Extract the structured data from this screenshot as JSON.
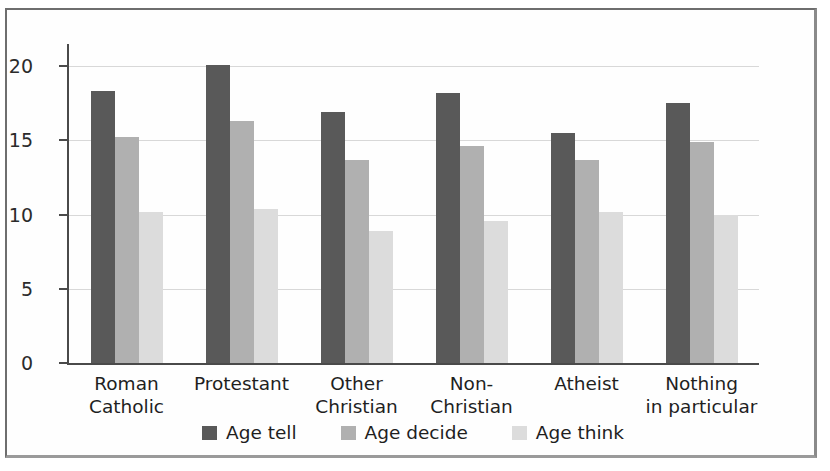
{
  "chart_data": {
    "type": "bar",
    "title": "",
    "subtitle": "",
    "xlabel": "",
    "ylabel": "",
    "categories": [
      "Roman\nCatholic",
      "Protestant",
      "Other\nChristian",
      "Non-\nChristian",
      "Atheist",
      "Nothing\nin particular"
    ],
    "series": [
      {
        "name": "Age tell",
        "color": "#595959",
        "values": [
          18.3,
          20.1,
          16.9,
          18.2,
          15.5,
          17.5
        ]
      },
      {
        "name": "Age decide",
        "color": "#b0b0b0",
        "values": [
          15.2,
          16.3,
          13.7,
          14.6,
          13.7,
          14.9
        ]
      },
      {
        "name": "Age think",
        "color": "#dcdcdc",
        "values": [
          10.2,
          10.4,
          8.9,
          9.6,
          10.2,
          10.0
        ]
      }
    ],
    "ylim": [
      0,
      21.5
    ],
    "yticks": [
      0,
      5,
      10,
      15,
      20
    ],
    "ytick_labels": [
      "0",
      "5",
      "10",
      "15",
      "20"
    ],
    "grid": true,
    "grid_axis": "y",
    "legend_position": "bottom-center",
    "bar_group_order": [
      "Age tell",
      "Age decide",
      "Age think"
    ]
  },
  "legend": {
    "items": [
      {
        "label": "Age tell",
        "swatch": "#595959"
      },
      {
        "label": "Age decide",
        "swatch": "#b0b0b0"
      },
      {
        "label": "Age think",
        "swatch": "#dcdcdc"
      }
    ]
  },
  "colors": {
    "axis": "#4a4a4a",
    "grid": "#d8d8d8",
    "frame": "#6e6e6e",
    "background": "#fefefe",
    "text": "#1f1f1f"
  }
}
